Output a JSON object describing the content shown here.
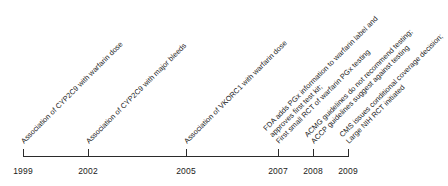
{
  "figure": {
    "type": "timeline",
    "axis": {
      "orientation": "horizontal",
      "start_year": 1999,
      "end_year": 2009,
      "tick_years": [
        "1999",
        "2002",
        "2005",
        "2007",
        "2008",
        "2009"
      ]
    },
    "label_rotation_degrees": -45,
    "colors": {
      "axis": "#2b2b2b",
      "text": "#1a1a1a",
      "background": "#ffffff"
    }
  },
  "ticks": [
    {
      "year": "1999",
      "x": 23
    },
    {
      "year": "2002",
      "x": 88
    },
    {
      "year": "2005",
      "x": 186
    },
    {
      "year": "2007",
      "x": 278
    },
    {
      "year": "2008",
      "x": 313
    },
    {
      "year": "2009",
      "x": 348
    }
  ],
  "events": [
    {
      "year": "1999",
      "x": 26,
      "lines": [
        "Association of CYP2C9 with warfarin dose"
      ]
    },
    {
      "year": "2002",
      "x": 91,
      "lines": [
        "Association of CYP2C9 with major bleeds"
      ]
    },
    {
      "year": "2005",
      "x": 189,
      "lines": [
        "Association of VKORC1 with warfarin dose"
      ]
    },
    {
      "year": "2007",
      "x": 281,
      "lines": [
        "FDA adds PGx information to warfarin label and",
        "approves first test kit;",
        "First small RCT of warfarin PGx testing"
      ]
    },
    {
      "year": "2008",
      "x": 316,
      "lines": [
        "ACMG guidelines do not recommend testing;",
        "ACCP guidelines suggest against testing"
      ]
    },
    {
      "year": "2009",
      "x": 351,
      "lines": [
        "CMS issues conditional coverage decision;",
        "Large NIH RCT initiated"
      ]
    }
  ]
}
